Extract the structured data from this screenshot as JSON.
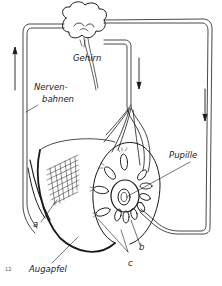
{
  "figure": {
    "number": "12",
    "labels": {
      "brain": "Gehirn",
      "nerves_line1": "Nerven-",
      "nerves_line2": "bahnen",
      "pupil": "Pupille",
      "eyeball": "Augapfel",
      "a": "a",
      "b": "b",
      "c": "c"
    },
    "colors": {
      "ink": "#1a1a1a",
      "background": "#ffffff"
    },
    "arrows": [
      {
        "position": "left",
        "direction": "up"
      },
      {
        "position": "center",
        "direction": "down"
      },
      {
        "position": "right",
        "direction": "down"
      }
    ]
  }
}
